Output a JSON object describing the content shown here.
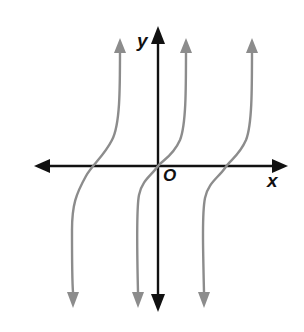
{
  "figure": {
    "type": "function-graph",
    "axes": {
      "x_label": "x",
      "y_label": "y",
      "origin_label": "O",
      "axis_color": "#111111"
    },
    "curves": {
      "color": "#8c8c8c",
      "count": 3,
      "x_axis_crossings_px": [
        95,
        158,
        225
      ]
    }
  }
}
